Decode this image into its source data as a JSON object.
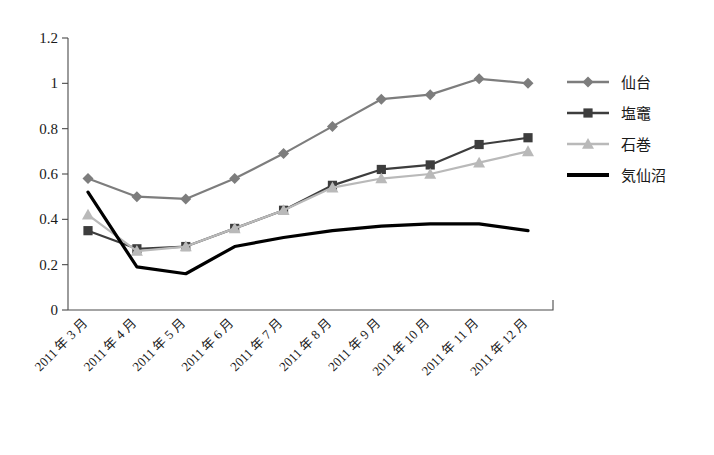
{
  "chart_data": {
    "type": "line",
    "title": "",
    "xlabel": "",
    "ylabel": "",
    "ylim": [
      0,
      1.2
    ],
    "grid": false,
    "legend_position": "right",
    "categories": [
      "2011 年 3 月",
      "2011 年 4 月",
      "2011 年 5 月",
      "2011 年 6 月",
      "2011 年 7 月",
      "2011 年 8 月",
      "2011 年 9 月",
      "2011 年 10 月",
      "2011 年 11 月",
      "2011 年 12 月"
    ],
    "ytick_labels": [
      "0",
      "0.2",
      "0.4",
      "0.6",
      "0.8",
      "1",
      "1.2"
    ],
    "ytick_values": [
      0,
      0.2,
      0.4,
      0.6,
      0.8,
      1,
      1.2
    ],
    "series": [
      {
        "name": "仙台",
        "marker": "diamond",
        "color": "#7d7d7d",
        "values": [
          0.58,
          0.5,
          0.49,
          0.58,
          0.69,
          0.81,
          0.93,
          0.95,
          1.02,
          1.0
        ]
      },
      {
        "name": "塩竈",
        "marker": "square",
        "color": "#3d3d3d",
        "values": [
          0.35,
          0.27,
          0.28,
          0.36,
          0.44,
          0.55,
          0.62,
          0.64,
          0.73,
          0.76
        ]
      },
      {
        "name": "石巻",
        "marker": "triangle",
        "color": "#b9b9b9",
        "values": [
          0.42,
          0.26,
          0.28,
          0.36,
          0.44,
          0.54,
          0.58,
          0.6,
          0.65,
          0.7
        ]
      },
      {
        "name": "気仙沼",
        "marker": "none",
        "color": "#000000",
        "values": [
          0.52,
          0.19,
          0.16,
          0.28,
          0.32,
          0.35,
          0.37,
          0.38,
          0.38,
          0.35
        ]
      }
    ]
  },
  "legend": {
    "items": [
      {
        "label": "仙台"
      },
      {
        "label": "塩竈"
      },
      {
        "label": "石巻"
      },
      {
        "label": "気仙沼"
      }
    ]
  }
}
